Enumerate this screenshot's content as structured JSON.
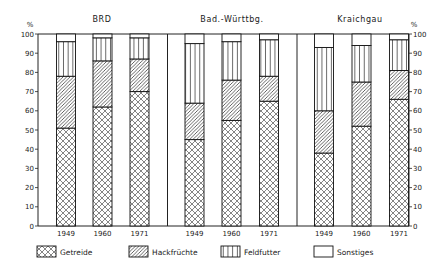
{
  "chart_data": {
    "type": "bar",
    "stacked": true,
    "unit_label": "%",
    "ylim": [
      0,
      100
    ],
    "yticks": [
      0,
      10,
      20,
      30,
      40,
      50,
      60,
      70,
      80,
      90,
      100
    ],
    "grid": false,
    "legend_position": "bottom",
    "categories": [
      "1949",
      "1960",
      "1971"
    ],
    "legend": [
      {
        "name": "Getreide",
        "pattern": "crosshatch"
      },
      {
        "name": "Hackfrüchte",
        "pattern": "diagonal"
      },
      {
        "name": "Feldfutter",
        "pattern": "vertical"
      },
      {
        "name": "Sonstiges",
        "pattern": "blank"
      }
    ],
    "panels": [
      {
        "title": "BRD",
        "series": [
          {
            "name": "Getreide",
            "values": [
              51,
              62,
              70
            ]
          },
          {
            "name": "Hackfrüchte",
            "values": [
              27,
              24,
              17
            ]
          },
          {
            "name": "Feldfutter",
            "values": [
              18,
              12,
              11
            ]
          },
          {
            "name": "Sonstiges",
            "values": [
              4,
              2,
              2
            ]
          }
        ]
      },
      {
        "title": "Bad.-Württbg.",
        "series": [
          {
            "name": "Getreide",
            "values": [
              45,
              55,
              65
            ]
          },
          {
            "name": "Hackfrüchte",
            "values": [
              19,
              21,
              13
            ]
          },
          {
            "name": "Feldfutter",
            "values": [
              31,
              20,
              19
            ]
          },
          {
            "name": "Sonstiges",
            "values": [
              5,
              4,
              3
            ]
          }
        ]
      },
      {
        "title": "Kraichgau",
        "series": [
          {
            "name": "Getreide",
            "values": [
              38,
              52,
              66
            ]
          },
          {
            "name": "Hackfrüchte",
            "values": [
              22,
              23,
              15
            ]
          },
          {
            "name": "Feldfutter",
            "values": [
              33,
              19,
              16
            ]
          },
          {
            "name": "Sonstiges",
            "values": [
              7,
              6,
              3
            ]
          }
        ]
      }
    ]
  }
}
